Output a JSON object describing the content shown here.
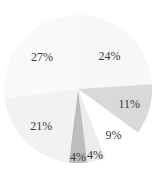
{
  "chart_data": {
    "type": "pie",
    "title": "",
    "start_angle_deg": 0,
    "direction": "clockwise",
    "slices": [
      {
        "label": "24%",
        "value": 24,
        "color": "#f7f7f7"
      },
      {
        "label": "11%",
        "value": 11,
        "color": "#d9d9d9"
      },
      {
        "label": "9%",
        "value": 9,
        "color": "#ffffff"
      },
      {
        "label": "4%",
        "value": 4,
        "color": "#ececec"
      },
      {
        "label": "4%",
        "value": 4,
        "color": "#bdbdbd"
      },
      {
        "label": "21%",
        "value": 21,
        "color": "#f2f2f2"
      },
      {
        "label": "27%",
        "value": 27,
        "color": "#f9f9f9"
      }
    ],
    "values": [
      24,
      11,
      9,
      4,
      4,
      21,
      27
    ],
    "categories": [
      "24%",
      "11%",
      "9%",
      "4%",
      "4%",
      "21%",
      "27%"
    ],
    "legend": "none"
  }
}
